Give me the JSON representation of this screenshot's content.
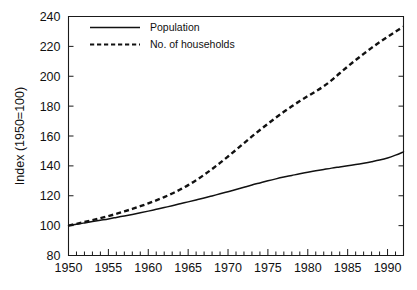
{
  "chart_data": {
    "type": "line",
    "title": "",
    "subtitle": "",
    "xlabel": "",
    "ylabel": "Index (1950=100)",
    "xlim": [
      1950,
      1992
    ],
    "ylim": [
      80,
      240
    ],
    "yticks": [
      80,
      100,
      120,
      140,
      160,
      180,
      200,
      220,
      240
    ],
    "xticks": [
      1950,
      1955,
      1960,
      1965,
      1970,
      1975,
      1980,
      1985,
      1990
    ],
    "xtick_labels": [
      "1950",
      "1955",
      "1960",
      "1965",
      "1970",
      "1975",
      "1980",
      "1985",
      "1990"
    ],
    "ytick_labels": [
      "80",
      "100",
      "120",
      "140",
      "160",
      "180",
      "200",
      "220",
      "240"
    ],
    "x_minor_tick_interval": 1,
    "grid": false,
    "legend_position": "top-left-inside",
    "x": [
      1950,
      1951,
      1952,
      1953,
      1954,
      1955,
      1956,
      1957,
      1958,
      1959,
      1960,
      1961,
      1962,
      1963,
      1964,
      1965,
      1966,
      1967,
      1968,
      1969,
      1970,
      1971,
      1972,
      1973,
      1974,
      1975,
      1976,
      1977,
      1978,
      1979,
      1980,
      1981,
      1982,
      1983,
      1984,
      1985,
      1986,
      1987,
      1988,
      1989,
      1990,
      1991,
      1992
    ],
    "series": [
      {
        "name": "Population",
        "style": "solid",
        "color": "#111111",
        "values": [
          100.0,
          100.9,
          101.8,
          102.7,
          103.6,
          104.5,
          105.5,
          106.5,
          107.5,
          108.6,
          109.7,
          110.9,
          112.1,
          113.3,
          114.6,
          115.9,
          117.2,
          118.5,
          119.9,
          121.3,
          122.7,
          124.2,
          125.7,
          127.2,
          128.6,
          130.0,
          131.3,
          132.5,
          133.6,
          134.7,
          135.7,
          136.7,
          137.6,
          138.5,
          139.3,
          140.1,
          140.9,
          141.8,
          142.8,
          143.9,
          145.3,
          147.2,
          149.4
        ]
      },
      {
        "name": "No. of households",
        "style": "dashed",
        "color": "#111111",
        "values": [
          100.0,
          101.2,
          102.4,
          103.7,
          105.0,
          106.4,
          107.9,
          109.5,
          111.2,
          113.0,
          114.9,
          116.9,
          119.1,
          121.5,
          124.2,
          127.1,
          130.4,
          134.0,
          137.9,
          142.0,
          146.3,
          150.7,
          155.2,
          159.7,
          164.0,
          168.2,
          172.3,
          176.2,
          179.9,
          183.4,
          186.7,
          189.9,
          193.3,
          197.4,
          202.0,
          206.5,
          210.8,
          215.0,
          219.0,
          222.8,
          226.4,
          229.8,
          233.2
        ]
      }
    ],
    "legend": [
      {
        "label": "Population",
        "style": "solid"
      },
      {
        "label": "No. of households",
        "style": "dashed"
      }
    ]
  }
}
